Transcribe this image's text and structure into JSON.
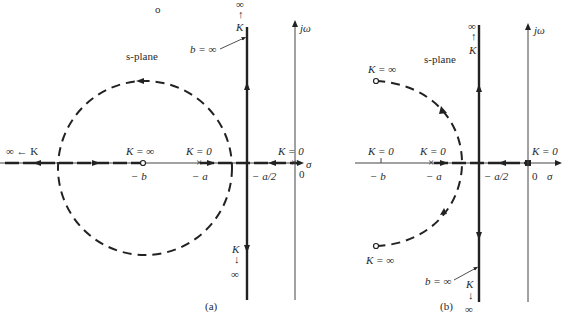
{
  "figure": {
    "panels": [
      {
        "id": "a",
        "caption": "(a)",
        "plane_label": "s-plane",
        "axis_labels": {
          "imag": "jω",
          "real": "σ"
        },
        "points": {
          "zero": {
            "label": "− b",
            "gain_label": "K = ∞"
          },
          "pole_a": {
            "label": "− a",
            "gain_label": "K = 0"
          },
          "pole_origin": {
            "label": "0",
            "gain_label": "K = 0"
          },
          "asymptote": {
            "label": "− a/2"
          }
        },
        "annotations": {
          "top_arrow": {
            "top": "∞",
            "arrow": "↑",
            "bottom": "K"
          },
          "bottom_arrow": {
            "top": "K",
            "arrow": "↓",
            "bottom": "∞"
          },
          "left_arrow": "∞ ← K",
          "b_inf": "b = ∞"
        }
      },
      {
        "id": "b",
        "caption": "(b)",
        "plane_label": "s-plane",
        "axis_labels": {
          "imag": "jω",
          "real": "σ"
        },
        "points": {
          "b_tick": {
            "label": "− b",
            "gain_label": "K = 0"
          },
          "pole_a": {
            "label": "− a",
            "gain_label": "K = 0"
          },
          "pole_origin": {
            "label": "0",
            "gain_label": "K = 0"
          },
          "asymptote": {
            "label": "− a/2"
          },
          "zero_upper": {
            "gain_label": "K = ∞"
          },
          "zero_lower": {
            "gain_label": "K = ∞"
          }
        },
        "annotations": {
          "top_arrow": {
            "top": "∞",
            "arrow": "↑",
            "bottom": "K"
          },
          "bottom_arrow": {
            "top": "K",
            "arrow": "↓",
            "bottom": "∞"
          },
          "b_inf": "b = ∞"
        }
      }
    ],
    "stray_mark": "o"
  }
}
